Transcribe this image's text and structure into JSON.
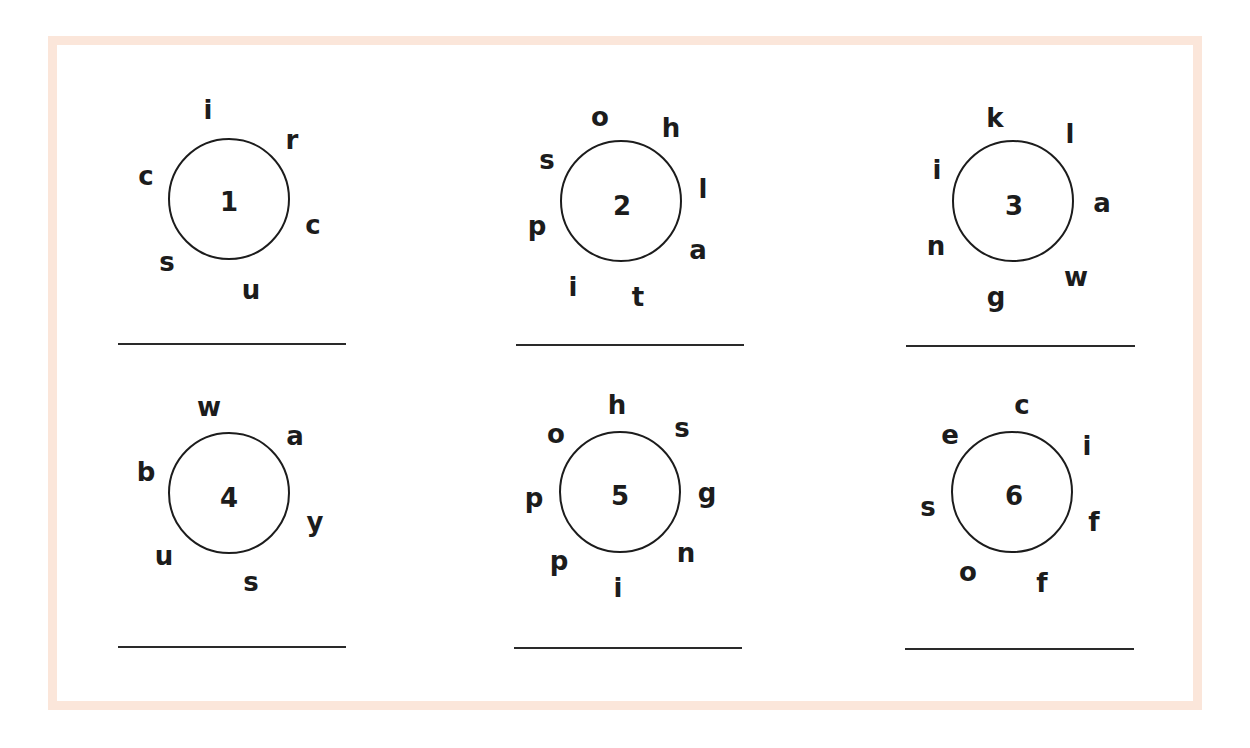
{
  "worksheet": {
    "border_color": "#fbe6da",
    "puzzles": [
      {
        "number": "1",
        "letters": [
          "i",
          "r",
          "c",
          "u",
          "s",
          "c"
        ],
        "answer": ""
      },
      {
        "number": "2",
        "letters": [
          "o",
          "h",
          "l",
          "a",
          "t",
          "i",
          "p",
          "s"
        ],
        "answer": ""
      },
      {
        "number": "3",
        "letters": [
          "k",
          "l",
          "a",
          "w",
          "g",
          "n",
          "i"
        ],
        "answer": ""
      },
      {
        "number": "4",
        "letters": [
          "w",
          "a",
          "y",
          "s",
          "u",
          "b"
        ],
        "answer": ""
      },
      {
        "number": "5",
        "letters": [
          "h",
          "s",
          "g",
          "n",
          "i",
          "p",
          "p",
          "o"
        ],
        "answer": ""
      },
      {
        "number": "6",
        "letters": [
          "c",
          "i",
          "f",
          "f",
          "o",
          "s",
          "e"
        ],
        "answer": ""
      }
    ]
  }
}
